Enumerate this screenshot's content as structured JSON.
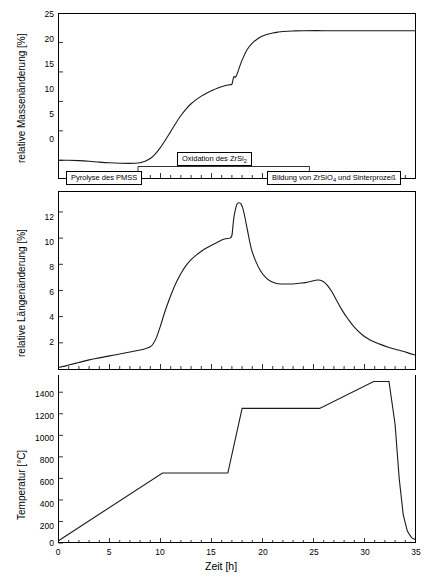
{
  "chart_data": {
    "type": "line",
    "title": "",
    "xlabel": "Zeit [h]",
    "xlim": [
      0,
      35
    ],
    "xticks": [
      0,
      5,
      10,
      15,
      20,
      25,
      30,
      35
    ],
    "grid": false,
    "legend": "none",
    "panels": [
      {
        "id": "mass",
        "ylabel": "relative Massenänderung [%]",
        "ylim": [
          -3,
          25
        ],
        "yticks": [
          0,
          5,
          10,
          15,
          20,
          25
        ],
        "series": [
          {
            "name": "relative Massenänderung",
            "x": [
              0,
              1,
              2,
              3,
              4,
              5,
              6,
              7,
              7.5,
              8,
              8.5,
              9,
              9.5,
              10,
              10.5,
              11,
              11.5,
              12,
              12.5,
              13,
              13.5,
              14,
              14.5,
              15,
              15.5,
              16,
              16.4,
              16.7,
              16.9,
              17.0,
              17.1,
              17.2,
              17.35,
              17.5,
              17.7,
              18,
              18.5,
              19,
              19.5,
              20,
              20.5,
              21,
              21.5,
              22,
              23,
              24,
              26,
              28,
              30,
              32,
              34,
              35
            ],
            "y": [
              0.0,
              0.0,
              -0.05,
              -0.15,
              -0.3,
              -0.42,
              -0.5,
              -0.52,
              -0.5,
              -0.4,
              -0.15,
              0.3,
              1.1,
              2.2,
              3.5,
              4.9,
              6.3,
              7.6,
              8.7,
              9.6,
              10.3,
              10.9,
              11.4,
              11.8,
              12.2,
              12.5,
              12.7,
              12.8,
              12.85,
              12.9,
              13.6,
              14.2,
              14.1,
              14.6,
              15.6,
              17.0,
              18.8,
              19.9,
              20.6,
              21.1,
              21.4,
              21.6,
              21.75,
              21.85,
              21.95,
              22.0,
              22.0,
              22.0,
              22.0,
              22.0,
              22.0,
              22.0
            ]
          }
        ],
        "annotations": [
          {
            "text_prefix": "Oxidation des ZrSi",
            "text_sub": "2",
            "text_suffix": "",
            "x_start": 7.8,
            "x_end": 24.6
          },
          {
            "text_prefix": "Pyrolyse des PMSS",
            "text_sub": "",
            "text_suffix": "",
            "x_start": 0.0,
            "x_end": 7.8
          },
          {
            "text_prefix": "Bildung von ZrSiO",
            "text_sub": "4",
            "text_suffix": " und Sinterprozeß",
            "x_start": 16.0,
            "x_end": 35.0
          }
        ]
      },
      {
        "id": "length",
        "ylabel": "relative Längenänderung [%]",
        "ylim": [
          0,
          13.6
        ],
        "yticks": [
          2,
          4,
          6,
          8,
          10,
          12
        ],
        "series": [
          {
            "name": "relative Längenänderung",
            "x": [
              0,
              0.5,
              1,
              2,
              3,
              4,
              5,
              6,
              7,
              8,
              8.5,
              9,
              9.3,
              9.6,
              10,
              10.4,
              10.8,
              11.2,
              11.6,
              12,
              12.5,
              13,
              13.5,
              14,
              14.5,
              15,
              15.5,
              16,
              16.4,
              16.8,
              17.0,
              17.1,
              17.2,
              17.35,
              17.5,
              17.7,
              17.9,
              18.1,
              18.3,
              18.6,
              18.9,
              19.3,
              19.8,
              20.3,
              20.8,
              21.3,
              21.8,
              22.4,
              23,
              23.6,
              24.2,
              24.8,
              25.2,
              25.5,
              25.8,
              26.1,
              26.4,
              26.8,
              27.3,
              27.8,
              28.4,
              29,
              29.8,
              30.6,
              31.5,
              32.4,
              33.3,
              34.2,
              35
            ],
            "y": [
              0.12,
              0.2,
              0.3,
              0.5,
              0.7,
              0.85,
              1.0,
              1.15,
              1.3,
              1.45,
              1.55,
              1.7,
              1.95,
              2.4,
              3.3,
              4.3,
              5.2,
              6.0,
              6.7,
              7.3,
              7.9,
              8.35,
              8.7,
              9.0,
              9.25,
              9.45,
              9.65,
              9.85,
              9.95,
              10.0,
              10.2,
              10.9,
              11.6,
              12.2,
              12.6,
              12.7,
              12.6,
              12.2,
              11.5,
              10.3,
              9.2,
              8.3,
              7.5,
              7.0,
              6.7,
              6.55,
              6.5,
              6.5,
              6.5,
              6.55,
              6.6,
              6.7,
              6.78,
              6.8,
              6.75,
              6.6,
              6.35,
              5.9,
              5.2,
              4.5,
              3.8,
              3.2,
              2.6,
              2.2,
              1.9,
              1.65,
              1.45,
              1.25,
              1.05
            ]
          }
        ],
        "annotations": []
      },
      {
        "id": "temperature",
        "ylabel": "Temperatur [°C]",
        "ylim": [
          0,
          1560
        ],
        "yticks": [
          0,
          200,
          400,
          600,
          800,
          1000,
          1200,
          1400
        ],
        "series": [
          {
            "name": "Temperatur",
            "x": [
              0,
              0.3,
              10.2,
              16.6,
              18.0,
              25.6,
              30.9,
              32.4,
              33.0,
              33.4,
              33.8,
              34.2,
              34.6,
              35
            ],
            "y": [
              20,
              40,
              650,
              650,
              1250,
              1250,
              1500,
              1500,
              1100,
              600,
              260,
              110,
              50,
              30
            ]
          }
        ],
        "annotations": []
      }
    ]
  }
}
